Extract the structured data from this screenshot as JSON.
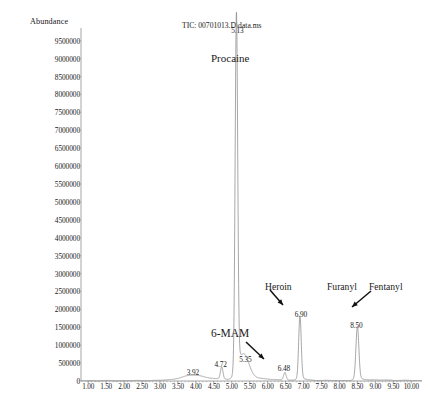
{
  "chart_data": {
    "type": "line",
    "title": "TIC: 00701013.D\\data.ms",
    "ylabel": "Abundance",
    "xlabel": "",
    "xlim": [
      0.8,
      10.3
    ],
    "ylim": [
      0,
      9800000
    ],
    "grid": false,
    "legend": null,
    "xticks": [
      "1.00",
      "1.50",
      "2.00",
      "2.50",
      "3.00",
      "3.50",
      "4.00",
      "4.50",
      "5.00",
      "5.50",
      "6.00",
      "6.50",
      "7.00",
      "7.50",
      "8.00",
      "8.50",
      "9.00",
      "9.50",
      "10.00"
    ],
    "xtick_values": [
      1.0,
      1.5,
      2.0,
      2.5,
      3.0,
      3.5,
      4.0,
      4.5,
      5.0,
      5.5,
      6.0,
      6.5,
      7.0,
      7.5,
      8.0,
      8.5,
      9.0,
      9.5,
      10.0
    ],
    "yticks": [
      "0",
      "500000",
      "1000000",
      "1500000",
      "2000000",
      "2500000",
      "3000000",
      "3500000",
      "4000000",
      "4500000",
      "5000000",
      "5500000",
      "6000000",
      "6500000",
      "7000000",
      "7500000",
      "8000000",
      "8500000",
      "9000000",
      "9500000"
    ],
    "ytick_values": [
      0,
      500000,
      1000000,
      1500000,
      2000000,
      2500000,
      3000000,
      3500000,
      4000000,
      4500000,
      5000000,
      5500000,
      6000000,
      6500000,
      7000000,
      7500000,
      8000000,
      8500000,
      9000000,
      9500000
    ],
    "peaks": [
      {
        "rt": 3.92,
        "label": "3.92",
        "height": 110000,
        "width": 0.3,
        "shape": "broad"
      },
      {
        "rt": 4.72,
        "label": "4.72",
        "height": 330000,
        "width": 0.035,
        "shape": "sharp"
      },
      {
        "rt": 5.13,
        "label": "5.13",
        "height": 9650000,
        "width": 0.035,
        "shape": "sharp"
      },
      {
        "rt": 5.35,
        "label": "5.35",
        "height": 480000,
        "width": 0.13,
        "shape": "broad"
      },
      {
        "rt": 6.48,
        "label": "6.48",
        "height": 210000,
        "width": 0.035,
        "shape": "sharp"
      },
      {
        "rt": 6.9,
        "label": "6.90",
        "height": 1720000,
        "width": 0.035,
        "shape": "sharp"
      },
      {
        "rt": 8.5,
        "label": "8.50",
        "height": 1430000,
        "width": 0.04,
        "shape": "sharp"
      }
    ],
    "annotations": [
      {
        "text": "Procaine",
        "rt": 5.13,
        "arrow": false
      },
      {
        "text": "6-MAM",
        "rt": 6.48,
        "arrow": true
      },
      {
        "text": "Heroin",
        "rt": 6.9,
        "arrow": true
      },
      {
        "text": "Furanyl",
        "rt": 8.5,
        "arrow": true
      },
      {
        "text": "Fentanyl",
        "rt": 8.5,
        "arrow": false
      }
    ],
    "colors": {
      "trace": "#8a8a8a",
      "axis": "#8f8f8f",
      "text": "#1a1a1a",
      "background": "#ffffff"
    }
  }
}
